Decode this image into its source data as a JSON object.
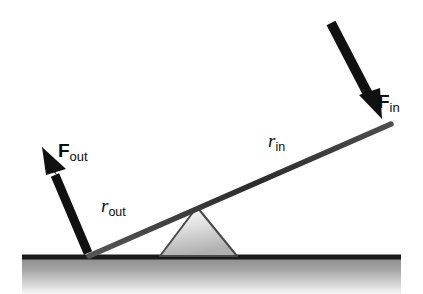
{
  "figure": {
    "background_color": "#ffffff"
  },
  "labels": {
    "force_in": {
      "base": "F",
      "sub": "in",
      "name": "input-force"
    },
    "force_out": {
      "base": "F",
      "sub": "out",
      "name": "output-force"
    },
    "radius_in": {
      "base": "r",
      "sub": "in",
      "name": "input-lever-arm"
    },
    "radius_out": {
      "base": "r",
      "sub": "out",
      "name": "output-lever-arm"
    }
  },
  "colors": {
    "lever_bar": "#333333",
    "arrow": "#111111",
    "ground_line": "#1a1a1a",
    "ground_fill_top": "#8f8f8f",
    "ground_fill_bottom": "#f2f2f2",
    "fulcrum_outline": "#4a4a4a",
    "fulcrum_fill_top": "#fafafa",
    "fulcrum_fill_bottom": "#b4b4b4",
    "text": "#0d0d0d"
  },
  "geometry": {
    "ground_y": 256,
    "lever_left_end": [
      90,
      256
    ],
    "lever_pivot": [
      197,
      208
    ],
    "lever_right_end": [
      390,
      125
    ],
    "fulcrum_apex": [
      197,
      208
    ],
    "fulcrum_base_left": [
      160,
      256
    ],
    "fulcrum_base_right": [
      237,
      256
    ],
    "force_in_arrow_start": [
      331,
      23
    ],
    "force_in_arrow_tip": [
      382,
      118
    ],
    "force_out_arrow_start": [
      88,
      252
    ],
    "force_out_arrow_tip": [
      42,
      147
    ]
  }
}
